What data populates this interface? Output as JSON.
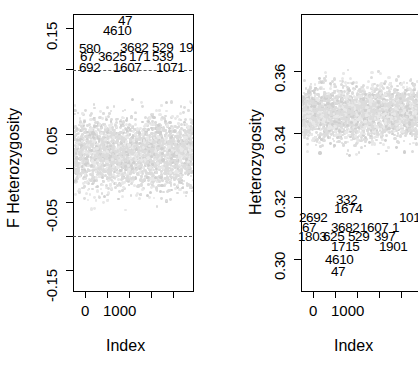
{
  "figure": {
    "type": "two-panel-scatter",
    "background": "#ffffff",
    "point_color": "#dcdcdc",
    "axis_color": "#000000",
    "refline_color": "#4d4d4d"
  },
  "chart_data": [
    {
      "id": "left-panel",
      "type": "scatter",
      "title": "",
      "xlabel": "Index",
      "ylabel": "F Heterozygosity",
      "xlim": [
        0,
        4700
      ],
      "ylim": [
        -0.17,
        0.17
      ],
      "xticks": [
        0,
        1000,
        2000,
        3000,
        4000
      ],
      "xticklabels": [
        "0",
        "1000",
        "",
        "",
        ""
      ],
      "yticks": [
        0.15,
        0.1,
        0.05,
        0.0,
        -0.05,
        -0.1,
        -0.15
      ],
      "yticklabels": [
        "0.15",
        "",
        "0.05",
        "",
        "-0.05",
        "",
        "-0.15"
      ],
      "grid": false,
      "legend": "none",
      "reference_lines": [
        {
          "y": 0.1,
          "style": "dashed"
        },
        {
          "y": -0.1,
          "style": "dashed"
        }
      ],
      "cloud": {
        "center": 0.0,
        "spread": 0.05,
        "n_points": 4700,
        "description": "dense light-grey band of points centred near 0"
      },
      "annotations": [
        {
          "label": "47",
          "row": 0,
          "col": 1
        },
        {
          "label": "4610",
          "row": 1,
          "col": 0
        },
        {
          "label": "580",
          "row": 2,
          "col": 0
        },
        {
          "label": "3682",
          "row": 2,
          "col": 1
        },
        {
          "label": "529",
          "row": 2,
          "col": 2
        },
        {
          "label": "19",
          "row": 2,
          "col": 3
        },
        {
          "label": "67",
          "row": 3,
          "col": 0
        },
        {
          "label": "3625",
          "row": 3,
          "col": 1
        },
        {
          "label": "171",
          "row": 3,
          "col": 2
        },
        {
          "label": "539",
          "row": 3,
          "col": 3
        },
        {
          "label": "692",
          "row": 4,
          "col": 0
        },
        {
          "label": "1607",
          "row": 4,
          "col": 1
        },
        {
          "label": "1071",
          "row": 4,
          "col": 2
        }
      ]
    },
    {
      "id": "right-panel",
      "type": "scatter",
      "title": "",
      "xlabel": "Index",
      "ylabel": "Heterozygosity",
      "xlim": [
        0,
        4700
      ],
      "ylim": [
        0.293,
        0.372
      ],
      "xticks": [
        0,
        1000,
        2000,
        3000,
        4000
      ],
      "xticklabels": [
        "0",
        "1000",
        "",
        "",
        ""
      ],
      "yticks": [
        0.36,
        0.34,
        0.32,
        0.3
      ],
      "yticklabels": [
        "0.36",
        "0.34",
        "0.32",
        "0.30"
      ],
      "grid": false,
      "legend": "none",
      "reference_lines": [],
      "cloud": {
        "center": 0.344,
        "spread": 0.009,
        "n_points": 4700,
        "description": "dense light-grey band of points centred near 0.344"
      },
      "annotations": [
        {
          "label": "332",
          "row": 0,
          "col": 1
        },
        {
          "label": "1674",
          "row": 1,
          "col": 1
        },
        {
          "label": "2692",
          "row": 2,
          "col": 0
        },
        {
          "label": "101",
          "row": 2,
          "col": 4
        },
        {
          "label": "67",
          "row": 3,
          "col": 0
        },
        {
          "label": "3682",
          "row": 3,
          "col": 1
        },
        {
          "label": "1607",
          "row": 3,
          "col": 2
        },
        {
          "label": "1",
          "row": 3,
          "col": 4
        },
        {
          "label": "1803",
          "row": 4,
          "col": 0
        },
        {
          "label": "625",
          "row": 4,
          "col": 1
        },
        {
          "label": "529",
          "row": 4,
          "col": 2
        },
        {
          "label": "397",
          "row": 4,
          "col": 3
        },
        {
          "label": "1715",
          "row": 5,
          "col": 1
        },
        {
          "label": "1901",
          "row": 5,
          "col": 3
        },
        {
          "label": "4610",
          "row": 6,
          "col": 1
        },
        {
          "label": "47",
          "row": 7,
          "col": 1
        }
      ]
    }
  ],
  "left": {
    "ylabel": "F Heterozygosity",
    "xlabel": "Index",
    "yticklabels": [
      "0.15",
      "0.05",
      "-0.05",
      "-0.15"
    ],
    "xticklabels": [
      "0",
      "1000"
    ],
    "labels": {
      "r0c1": "47",
      "r1c0": "4610",
      "r2c0": "580",
      "r2c1": "3682",
      "r2c2": "529",
      "r2c3": "19",
      "r3c0": "67",
      "r3c1": "3625",
      "r3c2": "171",
      "r3c3": "539",
      "r4c0": "692",
      "r4c1": "1607",
      "r4c2": "1071"
    }
  },
  "right": {
    "ylabel": "Heterozygosity",
    "xlabel": "Index",
    "yticklabels": [
      "0.36",
      "0.34",
      "0.32",
      "0.30"
    ],
    "xticklabels": [
      "0",
      "1000"
    ],
    "labels": {
      "r0c1": "332",
      "r1c1": "1674",
      "r2c0": "2692",
      "r2c4": "101",
      "r3c0": "67",
      "r3c1": "3682",
      "r3c2": "1607",
      "r3c4": "1",
      "r4c0": "1803",
      "r4c1": "625",
      "r4c2": "529",
      "r4c3": "397",
      "r5c1": "1715",
      "r5c3": "1901",
      "r6c1": "4610",
      "r7c1": "47"
    }
  }
}
